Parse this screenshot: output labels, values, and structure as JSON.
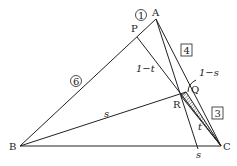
{
  "points": {
    "A": {
      "label": "A",
      "x": 156,
      "y": 19
    },
    "B": {
      "label": "B",
      "x": 20,
      "y": 146
    },
    "C": {
      "label": "C",
      "x": 221,
      "y": 146
    },
    "P": {
      "label": "P",
      "x": 137,
      "y": 37
    },
    "Q": {
      "label": "Q",
      "x": 186,
      "y": 92
    },
    "R": {
      "label": "R",
      "x": 181,
      "y": 96
    },
    "S": {
      "x": 198,
      "y": 146
    }
  },
  "labels": {
    "one_minus_t": "1−t",
    "one_minus_s": "1−s",
    "s_on_BR": "s",
    "s_on_BC": "s",
    "t_on_RC": "t",
    "circled_1": "1",
    "circled_6": "6",
    "boxed_4": "4",
    "boxed_3": "3"
  },
  "colors": {
    "stroke": "#222222",
    "hatch": "#222222",
    "background": "#ffffff"
  }
}
